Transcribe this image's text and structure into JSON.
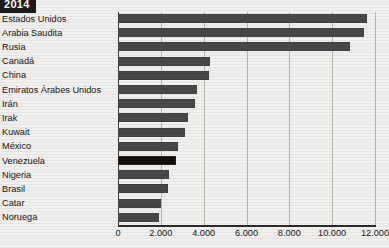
{
  "header": {
    "year_label": "2014"
  },
  "chart_data": {
    "type": "bar",
    "orientation": "horizontal",
    "title": "2014",
    "xlabel": "",
    "ylabel": "",
    "xlim": [
      0,
      12000
    ],
    "xticks": [
      0,
      2000,
      4000,
      6000,
      8000,
      10000,
      12000
    ],
    "xtick_labels": [
      "0",
      "2.000",
      "4.000",
      "6.000",
      "8.000",
      "10.000",
      "12.000"
    ],
    "grid": true,
    "legend": "none",
    "highlight_category": "Venezuela",
    "colors": {
      "bar": "#4a4846",
      "highlight": "#150f0c",
      "grid": "#b9b6b2",
      "axis": "#2b2b2b",
      "background": "#f2f0ee"
    },
    "categories": [
      "Estados Unidos",
      "Arabia Saudita",
      "Rusia",
      "Canadá",
      "China",
      "Emiratos Árabes Unidos",
      "Irán",
      "Irak",
      "Kuwait",
      "México",
      "Venezuela",
      "Nigeria",
      "Brasil",
      "Catar",
      "Noruega"
    ],
    "values": [
      11644,
      11505,
      10838,
      4292,
      4246,
      3712,
      3614,
      3285,
      3123,
      2784,
      2719,
      2361,
      2346,
      1994,
      1896
    ]
  }
}
